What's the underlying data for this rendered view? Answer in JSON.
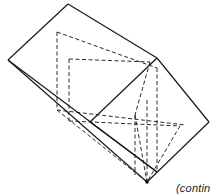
{
  "figure": {
    "type": "3d-solid-line-drawing",
    "stroke_color": "#1a1a1a",
    "visible_edges": [
      [
        [
          68,
          4
        ],
        [
          8,
          60
        ]
      ],
      [
        [
          68,
          4
        ],
        [
          157,
          58
        ]
      ],
      [
        [
          157,
          58
        ],
        [
          209,
          122
        ]
      ],
      [
        [
          209,
          122
        ],
        [
          147,
          182
        ]
      ],
      [
        [
          8,
          60
        ],
        [
          147,
          182
        ]
      ],
      [
        [
          8,
          60
        ],
        [
          157,
          172
        ]
      ],
      [
        [
          157,
          58
        ],
        [
          90,
          122
        ]
      ],
      [
        [
          90,
          122
        ],
        [
          157,
          172
        ]
      ]
    ],
    "hidden_edges": [
      [
        [
          57,
          32
        ],
        [
          157,
          68
        ]
      ],
      [
        [
          57,
          32
        ],
        [
          57,
          110
        ]
      ],
      [
        [
          69,
          59
        ],
        [
          150,
          62
        ]
      ],
      [
        [
          69,
          59
        ],
        [
          69,
          121
        ]
      ],
      [
        [
          57,
          110
        ],
        [
          185,
          125
        ]
      ],
      [
        [
          69,
          121
        ],
        [
          180,
          126
        ]
      ],
      [
        [
          150,
          62
        ],
        [
          135,
          115
        ]
      ],
      [
        [
          135,
          115
        ],
        [
          135,
          175
        ]
      ],
      [
        [
          157,
          68
        ],
        [
          157,
          172
        ]
      ],
      [
        [
          180,
          126
        ],
        [
          147,
          182
        ]
      ],
      [
        [
          57,
          110
        ],
        [
          147,
          182
        ]
      ],
      [
        [
          135,
          115
        ],
        [
          147,
          182
        ]
      ],
      [
        [
          147,
          100
        ],
        [
          147,
          182
        ]
      ]
    ],
    "vertex_dot": [
      147,
      182
    ]
  },
  "caption": {
    "text": "(contin"
  }
}
